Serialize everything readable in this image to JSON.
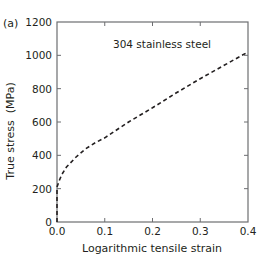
{
  "chart_data": {
    "type": "line",
    "panel_label": "(a)",
    "title": "",
    "annotation": "304 stainless steel",
    "xlabel": "Logarithmic tensile strain",
    "ylabel": "True stress  (MPa)",
    "xlim": [
      0.0,
      0.4
    ],
    "ylim": [
      0,
      1200
    ],
    "x_ticks": [
      "0.0",
      "0.1",
      "0.2",
      "0.3",
      "0.4"
    ],
    "y_ticks": [
      "0",
      "200",
      "400",
      "600",
      "800",
      "1000",
      "1200"
    ],
    "grid": false,
    "legend": null,
    "series": [
      {
        "name": "304 stainless steel",
        "style": "dashed",
        "color": "#231f20",
        "x": [
          0.0,
          0.0,
          0.005,
          0.01,
          0.02,
          0.04,
          0.06,
          0.08,
          0.1,
          0.15,
          0.2,
          0.25,
          0.3,
          0.35,
          0.4
        ],
        "y": [
          0,
          210,
          250,
          285,
          330,
          390,
          440,
          475,
          505,
          600,
          685,
          775,
          860,
          940,
          1020
        ]
      }
    ]
  }
}
